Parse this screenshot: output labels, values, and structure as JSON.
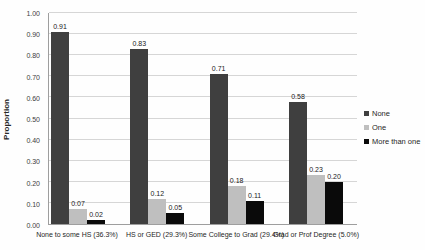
{
  "chart_data": {
    "type": "bar",
    "title": "",
    "xlabel": "",
    "ylabel": "Proportion",
    "ylim": [
      0,
      1.0
    ],
    "yticks": [
      "0.00",
      "0.10",
      "0.20",
      "0.30",
      "0.40",
      "0.50",
      "0.60",
      "0.70",
      "0.80",
      "0.90",
      "1.00"
    ],
    "grid": true,
    "data_labels": true,
    "legend_position": "right",
    "categories": [
      "None to some HS (36.3%)",
      "HS or GED (29.3%)",
      "Some College to Grad (29.4%)",
      "Grad or Prof Degree (5.0%)"
    ],
    "series": [
      {
        "name": "None",
        "color": "#3f3f3f",
        "values": [
          0.91,
          0.83,
          0.71,
          0.58
        ]
      },
      {
        "name": "One",
        "color": "#bfbfbf",
        "values": [
          0.07,
          0.12,
          0.18,
          0.23
        ]
      },
      {
        "name": "More than one",
        "color": "#0a0a0a",
        "values": [
          0.02,
          0.05,
          0.11,
          0.2
        ]
      }
    ]
  },
  "colors": {
    "gridline": "#d6d6d6",
    "axis": "#9e9e9e",
    "text": "#262626"
  }
}
